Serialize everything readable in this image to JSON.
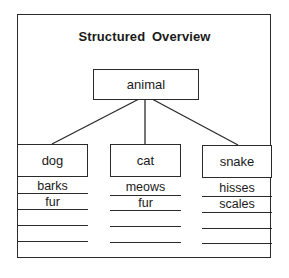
{
  "diagram": {
    "title": "Structured Overview",
    "root": {
      "label": "animal"
    },
    "children": [
      {
        "label": "dog",
        "attributes": [
          "barks",
          "fur",
          "",
          "",
          ""
        ]
      },
      {
        "label": "cat",
        "attributes": [
          "meows",
          "fur",
          "",
          "",
          ""
        ]
      },
      {
        "label": "snake",
        "attributes": [
          "hisses",
          "scales",
          "",
          "",
          ""
        ]
      }
    ],
    "colors": {
      "line": "#2a2a2a",
      "background": "#ffffff",
      "text": "#1a1a1a"
    }
  }
}
